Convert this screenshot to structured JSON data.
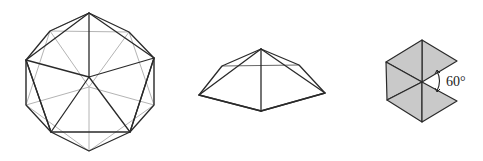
{
  "figure": {
    "colors": {
      "edge": "#2a2a2a",
      "hidden_edge": "#b4b4b4",
      "face_fill": "#c9c9c9",
      "background": "#ffffff"
    },
    "icosahedron": {
      "name": "icosahedron",
      "center": [
        89,
        77
      ],
      "back_center": [
        89,
        87
      ],
      "outer": {
        "T": [
          89,
          13
        ],
        "UR": [
          129,
          32
        ],
        "R": [
          154,
          58
        ],
        "LR": [
          154,
          105
        ],
        "BR": [
          130,
          132
        ],
        "B": [
          89,
          151
        ],
        "BL": [
          51,
          132
        ],
        "LL": [
          26,
          105
        ],
        "L": [
          26,
          60
        ],
        "UL": [
          50,
          31
        ]
      }
    },
    "pyramid": {
      "name": "pentagonal-pyramid",
      "apex": [
        261,
        49
      ],
      "base": {
        "left_back": [
          222,
          66
        ],
        "right_back": [
          299,
          65
        ],
        "left_front": [
          199,
          95
        ],
        "right_front": [
          325,
          93
        ],
        "front": [
          261,
          111
        ]
      }
    },
    "net": {
      "name": "triangle-net",
      "center": [
        422,
        82
      ],
      "angle_label": "60°"
    }
  }
}
